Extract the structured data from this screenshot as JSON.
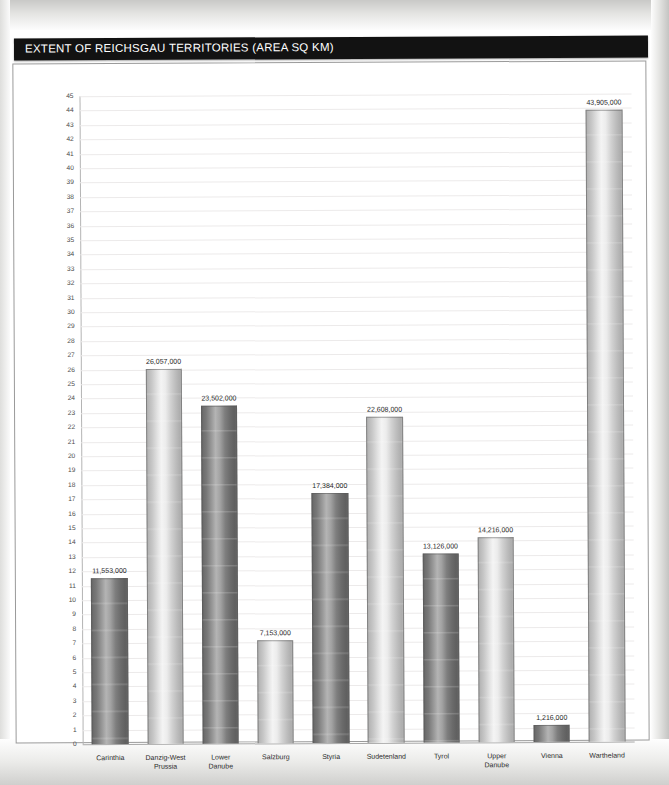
{
  "header": {
    "title": "EXTENT OF REICHSGAU TERRITORIES (AREA SQ KM)"
  },
  "chart_data": {
    "type": "bar",
    "title": "EXTENT OF REICHSGAU TERRITORIES (AREA SQ KM)",
    "xlabel": "",
    "ylabel": "",
    "ylim": [
      0,
      45
    ],
    "ytick_step": 1,
    "grid": true,
    "legend": "none",
    "value_scale": 1000000,
    "value_scale_note": "Bar heights plotted in millions; axis ticks 0-45 correspond to value/1,000,000",
    "yticks": [
      "0",
      "1",
      "2",
      "3",
      "4",
      "5",
      "6",
      "7",
      "8",
      "9",
      "10",
      "11",
      "12",
      "13",
      "14",
      "15",
      "16",
      "17",
      "18",
      "19",
      "20",
      "21",
      "22",
      "23",
      "24",
      "25",
      "26",
      "27",
      "28",
      "29",
      "30",
      "31",
      "32",
      "33",
      "34",
      "35",
      "36",
      "37",
      "38",
      "39",
      "40",
      "41",
      "42",
      "43",
      "44",
      "45"
    ],
    "categories": [
      "Carinthia",
      "Danzig-West\nPrussia",
      "Lower\nDanube",
      "Salzburg",
      "Styria",
      "Sudetenland",
      "Tyrol",
      "Upper\nDanube",
      "Vienna",
      "Wartheland"
    ],
    "values": [
      11553000,
      26057000,
      23502000,
      7153000,
      17384000,
      22608000,
      13126000,
      14216000,
      1216000,
      43905000
    ],
    "value_labels": [
      "11,553,000",
      "26,057,000",
      "23,502,000",
      "7,153,000",
      "17,384,000",
      "22,608,000",
      "13,126,000",
      "14,216,000",
      "1,216,000",
      "43,905,000"
    ],
    "bar_styles": [
      "dark",
      "light",
      "dark",
      "light",
      "dark",
      "light",
      "dark",
      "light",
      "dark",
      "light"
    ]
  },
  "colors": {
    "title_bar_background": "#121212",
    "title_bar_text": "#ffffff",
    "plot_background": "#ffffff",
    "gridline": "#eceaea",
    "axis_line": "#b4b4b4",
    "bar_dark": "#6e6e6e",
    "bar_light": "#d2d2d2",
    "page_background": "#d8d8d6"
  }
}
